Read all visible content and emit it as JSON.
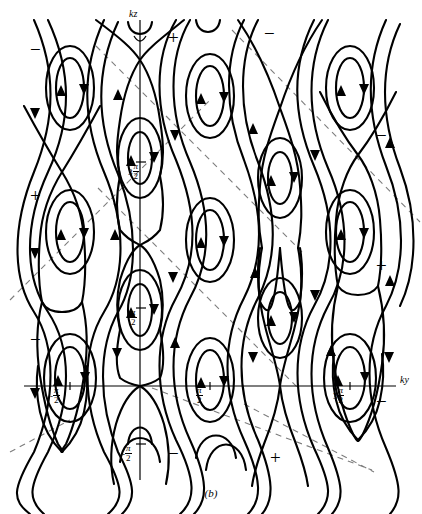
{
  "figure": {
    "caption": "(b)",
    "axes": {
      "vertical_label": "kz",
      "horizontal_label": "ky"
    },
    "tick_labels": {
      "x": [
        {
          "lead": "-",
          "num": "π",
          "den": "2"
        },
        {
          "lead": "",
          "num": "π",
          "den": "2"
        },
        {
          "lead": "3",
          "num": "π",
          "den": "2"
        }
      ],
      "y": [
        {
          "lead": "3",
          "num": "π",
          "den": "2"
        },
        {
          "lead": "",
          "num": "π",
          "den": "2"
        },
        {
          "lead": "-",
          "num": "π",
          "den": "2"
        }
      ]
    },
    "signs": [
      {
        "text": "−",
        "x": 30,
        "y": 40
      },
      {
        "text": "+",
        "x": 168,
        "y": 28
      },
      {
        "text": "−",
        "x": 264,
        "y": 24
      },
      {
        "text": "−",
        "x": 376,
        "y": 126
      },
      {
        "text": "+",
        "x": 30,
        "y": 186
      },
      {
        "text": "+",
        "x": 376,
        "y": 256
      },
      {
        "text": "−",
        "x": 30,
        "y": 330
      },
      {
        "text": "−",
        "x": 376,
        "y": 392
      },
      {
        "text": "−",
        "x": 168,
        "y": 444
      },
      {
        "text": "+",
        "x": 270,
        "y": 448
      }
    ]
  },
  "chart_data": {
    "type": "line",
    "title": "",
    "subtitle": "",
    "xlabel": "ky",
    "ylabel": "kz",
    "grid": false,
    "legend": null,
    "x_axis": {
      "label": "ky",
      "tick_values": [
        -1.5708,
        1.5708,
        4.7124
      ],
      "tick_text": [
        "-π/2",
        "π/2",
        "3π/2"
      ],
      "origin_px": 140,
      "range_px": [
        24,
        400
      ]
    },
    "y_axis": {
      "label": "kz",
      "tick_values": [
        4.7124,
        1.5708,
        -1.5708
      ],
      "tick_text": [
        "3π/2",
        "π/2",
        "-π/2"
      ],
      "origin_px": 386,
      "range_px": [
        20,
        480
      ]
    },
    "saddle_points_px": [
      [
        140,
        60
      ],
      [
        140,
        180
      ],
      [
        140,
        245
      ],
      [
        140,
        386
      ],
      [
        280,
        108
      ],
      [
        280,
        248
      ],
      [
        280,
        386
      ],
      [
        280,
        466
      ],
      [
        62,
        172
      ],
      [
        62,
        312
      ],
      [
        62,
        452
      ],
      [
        358,
        155
      ],
      [
        358,
        295
      ],
      [
        358,
        440
      ],
      [
        20,
        100
      ],
      [
        20,
        240
      ],
      [
        20,
        380
      ],
      [
        420,
        100
      ],
      [
        420,
        240
      ],
      [
        420,
        380
      ]
    ],
    "center_points_px": [
      [
        70,
        88
      ],
      [
        70,
        232
      ],
      [
        70,
        372
      ],
      [
        210,
        92
      ],
      [
        210,
        232
      ],
      [
        210,
        372
      ],
      [
        350,
        88
      ],
      [
        350,
        232
      ],
      [
        350,
        372
      ],
      [
        140,
        158
      ],
      [
        140,
        310
      ],
      [
        140,
        448
      ],
      [
        280,
        178
      ],
      [
        280,
        318
      ],
      [
        280,
        458
      ]
    ],
    "separatrix_lines": [
      {
        "from_px": [
          8,
          300
        ],
        "to_px": [
          210,
          100
        ]
      },
      {
        "from_px": [
          96,
          48
        ],
        "to_px": [
          300,
          250
        ]
      },
      {
        "from_px": [
          96,
          190
        ],
        "to_px": [
          300,
          392
        ]
      },
      {
        "from_px": [
          150,
          390
        ],
        "to_px": [
          368,
          470
        ]
      },
      {
        "from_px": [
          230,
          30
        ],
        "to_px": [
          420,
          225
        ]
      },
      {
        "from_px": [
          8,
          445
        ],
        "to_px": [
          140,
          388
        ]
      }
    ],
    "series": [
      {
        "name": "closed-orbit",
        "values": []
      },
      {
        "name": "open-streamline",
        "values": []
      },
      {
        "name": "separatrix",
        "values": []
      }
    ]
  }
}
